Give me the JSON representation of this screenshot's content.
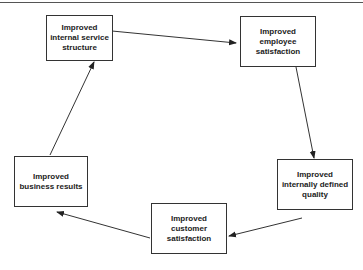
{
  "diagram": {
    "type": "cycle",
    "nodes": [
      {
        "id": "n1",
        "label": "Improved internal service structure"
      },
      {
        "id": "n2",
        "label": "Improved employee satisfaction"
      },
      {
        "id": "n3",
        "label": "Improved internally defined quality"
      },
      {
        "id": "n4",
        "label": "Improved customer satisfaction"
      },
      {
        "id": "n5",
        "label": "Improved business results"
      }
    ],
    "edges": [
      {
        "from": "n1",
        "to": "n2"
      },
      {
        "from": "n2",
        "to": "n3"
      },
      {
        "from": "n3",
        "to": "n4"
      },
      {
        "from": "n4",
        "to": "n5"
      },
      {
        "from": "n5",
        "to": "n1"
      }
    ]
  }
}
